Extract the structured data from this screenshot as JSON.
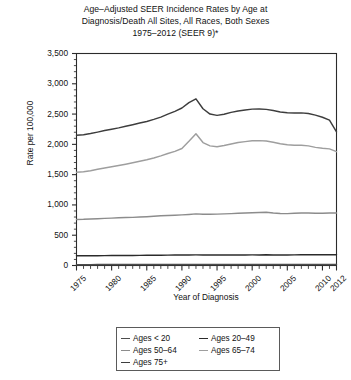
{
  "chart_data": {
    "type": "line",
    "title": "Age–Adjusted SEER Incidence Rates by Age at Diagnosis/Death All Sites, All Races, Both Sexes 1975–2012 (SEER 9)*",
    "title_lines": [
      "Age–Adjusted SEER Incidence Rates by Age at",
      "Diagnosis/Death All Sites, All Races, Both Sexes",
      "1975–2012 (SEER 9)*"
    ],
    "xlabel": "Year of Diagnosis",
    "ylabel": "Rate per 100,000",
    "grid": false,
    "legend_position": "bottom",
    "xlim": [
      1975,
      2012
    ],
    "ylim": [
      0,
      3500
    ],
    "ytick_values": [
      0,
      500,
      1000,
      1500,
      2000,
      2500,
      3000,
      3500
    ],
    "ytick_labels": [
      "0",
      "500",
      "1,000",
      "1,500",
      "2,000",
      "2,500",
      "3,000",
      "3,500"
    ],
    "xtick_values": [
      1975,
      1980,
      1985,
      1990,
      1995,
      2000,
      2005,
      2010,
      2012
    ],
    "xtick_labels": [
      "1975",
      "1980",
      "1985",
      "1990",
      "1995",
      "2000",
      "2005",
      "2010",
      "2012"
    ],
    "x": [
      1975,
      1976,
      1977,
      1978,
      1979,
      1980,
      1981,
      1982,
      1983,
      1984,
      1985,
      1986,
      1987,
      1988,
      1989,
      1990,
      1991,
      1992,
      1993,
      1994,
      1995,
      1996,
      1997,
      1998,
      1999,
      2000,
      2001,
      2002,
      2003,
      2004,
      2005,
      2006,
      2007,
      2008,
      2009,
      2010,
      2011,
      2012
    ],
    "series": [
      {
        "name": "Ages < 20",
        "color": "#4d4d4d",
        "values": [
          14,
          14,
          14,
          15,
          15,
          15,
          15,
          15,
          15,
          16,
          16,
          16,
          16,
          16,
          16,
          16,
          17,
          17,
          17,
          17,
          17,
          17,
          17,
          17,
          17,
          17,
          17,
          17,
          17,
          18,
          18,
          18,
          18,
          18,
          18,
          18,
          18,
          18
        ]
      },
      {
        "name": "Ages 20–49",
        "color": "#2b2b2b",
        "values": [
          160,
          160,
          161,
          162,
          163,
          164,
          165,
          166,
          166,
          167,
          168,
          169,
          170,
          171,
          172,
          173,
          174,
          175,
          174,
          173,
          173,
          173,
          173,
          174,
          174,
          175,
          175,
          176,
          174,
          174,
          174,
          175,
          176,
          176,
          176,
          176,
          177,
          178
        ]
      },
      {
        "name": "Ages 50–64",
        "color": "#8c8c8c",
        "values": [
          760,
          762,
          768,
          773,
          778,
          782,
          788,
          792,
          795,
          800,
          806,
          812,
          820,
          826,
          830,
          836,
          843,
          852,
          846,
          845,
          848,
          852,
          856,
          862,
          866,
          872,
          876,
          880,
          866,
          858,
          856,
          862,
          868,
          866,
          862,
          862,
          866,
          868
        ]
      },
      {
        "name": "Ages 65–74",
        "color": "#9e9e9e",
        "values": [
          1540,
          1548,
          1565,
          1588,
          1610,
          1630,
          1650,
          1672,
          1695,
          1720,
          1745,
          1775,
          1810,
          1850,
          1885,
          1932,
          2050,
          2175,
          2030,
          1975,
          1962,
          1980,
          2005,
          2030,
          2045,
          2060,
          2062,
          2055,
          2035,
          2010,
          1995,
          1985,
          1985,
          1975,
          1950,
          1935,
          1925,
          1880
        ]
      },
      {
        "name": "Ages 75+",
        "color": "#3d3d3d",
        "values": [
          2150,
          2158,
          2178,
          2202,
          2228,
          2250,
          2272,
          2298,
          2325,
          2352,
          2378,
          2412,
          2450,
          2498,
          2545,
          2600,
          2688,
          2752,
          2588,
          2500,
          2478,
          2498,
          2528,
          2552,
          2568,
          2582,
          2585,
          2578,
          2558,
          2535,
          2522,
          2518,
          2520,
          2510,
          2482,
          2448,
          2400,
          2208
        ]
      }
    ]
  },
  "legend": {
    "items": [
      {
        "label": "Ages < 20"
      },
      {
        "label": "Ages 20–49"
      },
      {
        "label": "Ages 50–64"
      },
      {
        "label": "Ages 65–74"
      },
      {
        "label": "Ages 75+"
      }
    ]
  },
  "colors": {
    "axis": "#2b2b2b",
    "text": "#111111",
    "background": "#ffffff"
  }
}
